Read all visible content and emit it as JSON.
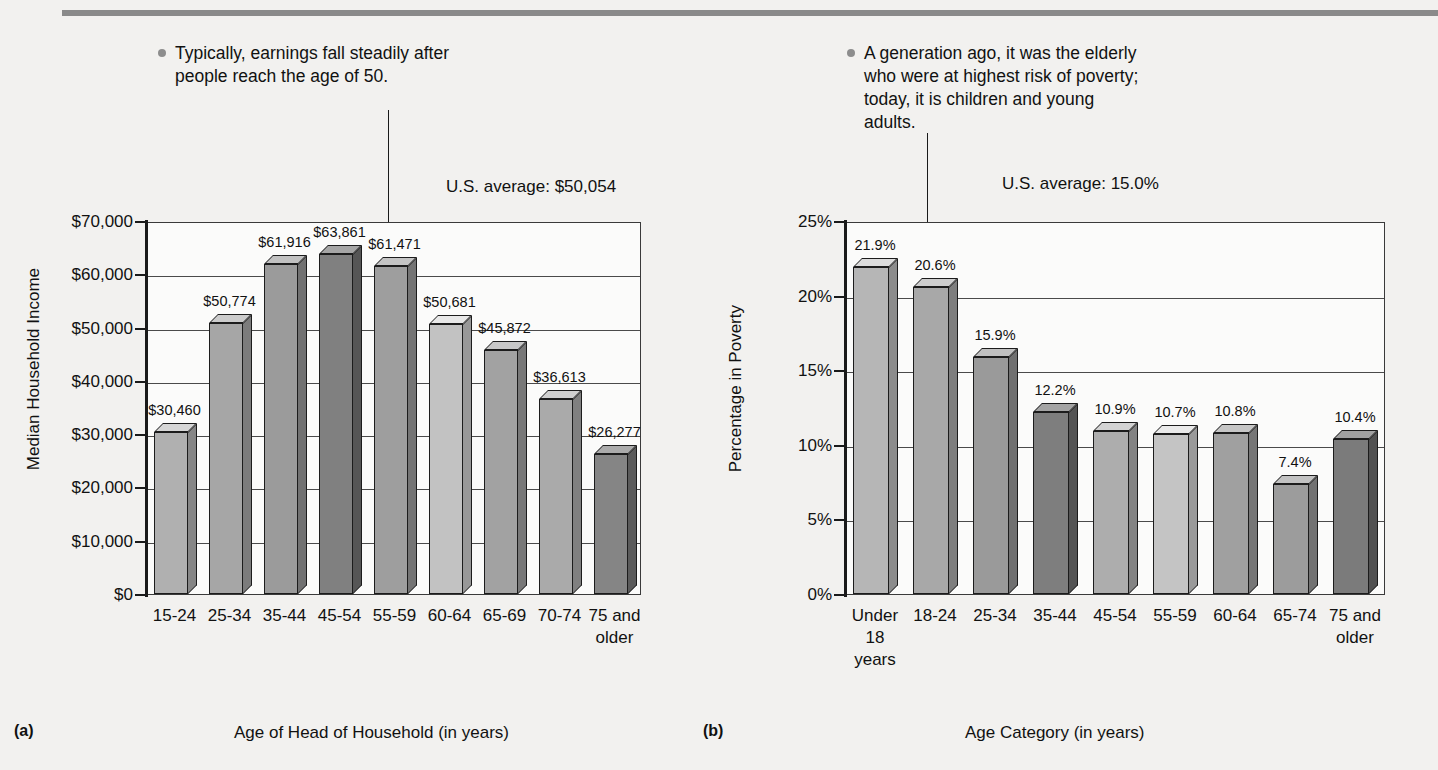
{
  "figure": {
    "panel_a_number": "(a)",
    "panel_b_number": "(b)"
  },
  "callouts": {
    "a": "Typically, earnings fall steadily after people reach the age of 50.",
    "b": "A generation ago, it was the elderly who were at highest risk of poverty; today, it is children and young adults."
  },
  "annotations": {
    "a_average": "U.S. average: $50,054",
    "b_average": "U.S. average: 15.0%"
  },
  "colors": {
    "rule": "#8a8a8a",
    "background": "#f2f1ef",
    "plot_background": "#fbfbfa",
    "axis": "#1a1a1a",
    "gridline": "#4a4a4a",
    "bullet": "#8d8d8d"
  },
  "chart_data": [
    {
      "type": "bar",
      "panel": "(a)",
      "title": "",
      "xlabel": "Age of Head of Household (in years)",
      "ylabel": "Median Household Income",
      "ylim": [
        0,
        70000
      ],
      "ytick_labels": [
        "$0",
        "$10,000",
        "$20,000",
        "$30,000",
        "$40,000",
        "$50,000",
        "$60,000",
        "$70,000"
      ],
      "ytick_values": [
        0,
        10000,
        20000,
        30000,
        40000,
        50000,
        60000,
        70000
      ],
      "grid": true,
      "categories": [
        "15-24",
        "25-34",
        "35-44",
        "45-54",
        "55-59",
        "60-64",
        "65-69",
        "70-74",
        "75 and\nolder"
      ],
      "values": [
        30460,
        50774,
        61916,
        63861,
        61471,
        50681,
        45872,
        36613,
        26277
      ],
      "data_labels": [
        "$30,460",
        "$50,774",
        "$61,916",
        "$63,861",
        "$61,471",
        "$50,681",
        "$45,872",
        "$36,613",
        "$26,277"
      ],
      "bar_shades": [
        "#b0b0b0",
        "#a6a6a6",
        "#9b9b9b",
        "#808080",
        "#9e9e9e",
        "#c2c2c2",
        "#a2a2a2",
        "#aaaaaa",
        "#858585"
      ],
      "reference_line": "U.S. average: $50,054"
    },
    {
      "type": "bar",
      "panel": "(b)",
      "title": "",
      "xlabel": "Age Category (in years)",
      "ylabel": "Percentage in Poverty",
      "ylim": [
        0,
        25
      ],
      "ytick_labels": [
        "0%",
        "5%",
        "10%",
        "15%",
        "20%",
        "25%"
      ],
      "ytick_values": [
        0,
        5,
        10,
        15,
        20,
        25
      ],
      "grid": true,
      "categories": [
        "Under\n18\nyears",
        "18-24",
        "25-34",
        "35-44",
        "45-54",
        "55-59",
        "60-64",
        "65-74",
        "75 and\nolder"
      ],
      "values": [
        21.9,
        20.6,
        15.9,
        12.2,
        10.9,
        10.7,
        10.8,
        7.4,
        10.4
      ],
      "data_labels": [
        "21.9%",
        "20.6%",
        "15.9%",
        "12.2%",
        "10.9%",
        "10.7%",
        "10.8%",
        "7.4%",
        "10.4%"
      ],
      "bar_shades": [
        "#b6b6b6",
        "#a8a8a8",
        "#9a9a9a",
        "#7e7e7e",
        "#adadad",
        "#c4c4c4",
        "#a0a0a0",
        "#9c9c9c",
        "#7b7b7b"
      ],
      "reference_line": "U.S. average: 15.0%"
    }
  ]
}
